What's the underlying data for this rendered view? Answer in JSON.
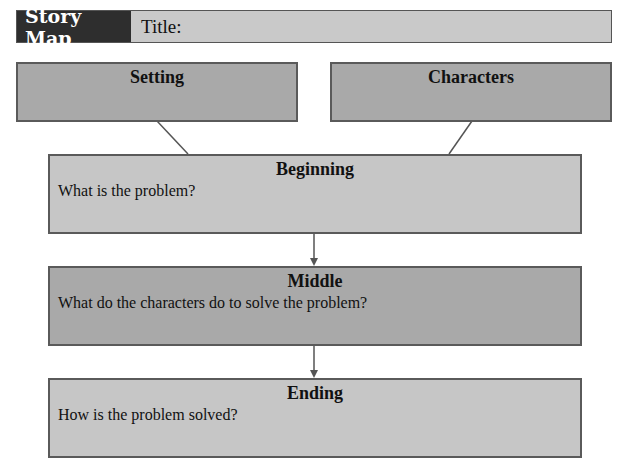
{
  "header": {
    "label": "Story Map",
    "title_label": "Title:"
  },
  "setting": {
    "heading": "Setting"
  },
  "characters": {
    "heading": "Characters"
  },
  "beginning": {
    "heading": "Beginning",
    "prompt": "What is the problem?"
  },
  "middle": {
    "heading": "Middle",
    "prompt": "What do the characters do to solve the problem?"
  },
  "ending": {
    "heading": "Ending",
    "prompt": "How is the problem solved?"
  },
  "colors": {
    "header_dark": "#2e2e2e",
    "box_dark": "#a9a9a9",
    "box_light": "#c6c6c6",
    "border": "#5a5a5a"
  }
}
